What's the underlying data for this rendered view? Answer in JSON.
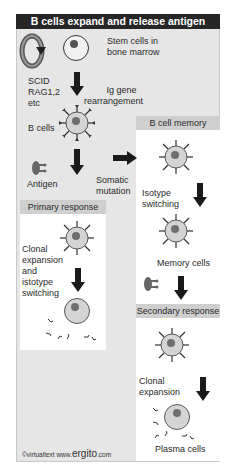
{
  "title": "B cells expand and release antigen",
  "labels": {
    "stem_cells": "Stem cells in\nbone marrow",
    "stem_line1": "Stem cells in",
    "stem_line2": "bone marrow",
    "scid_line1": "SCID",
    "scid_line2": "RAG1,2",
    "scid_line3": "etc",
    "ig_line1": "Ig gene",
    "ig_line2": "rearrangement",
    "b_cells": "B cells",
    "antigen": "Antigen",
    "somatic_line1": "Somatic",
    "somatic_line2": "mutation",
    "isotype_line1": "Isotype",
    "isotype_line2": "switching",
    "memory_cells": "Memory cells",
    "clonal1_line1": "Clonal",
    "clonal1_line2": "expansion",
    "clonal1_line3": "and",
    "clonal1_line4": "istotype",
    "clonal1_line5": "switching",
    "clonal2_line1": "Clonal",
    "clonal2_line2": "expansion",
    "plasma_cells": "Plasma cells"
  },
  "panels": {
    "b_cell_memory": "B cell memory",
    "primary_response": "Primary response",
    "secondary_response": "Secondary response"
  },
  "footer": {
    "copyright": "©virtualtext",
    "www": "www.",
    "brand": "ergito",
    "tld": ".com"
  },
  "colors": {
    "title_bg": "#262626",
    "frame_bg": "#e6e6e6",
    "panel_bg": "#ffffff",
    "panel_title_bg": "#cfcfcf",
    "cell_fill": "#d4d4d4",
    "nucleus": "#6e6e6e",
    "arrow": "#1a1a1a"
  }
}
